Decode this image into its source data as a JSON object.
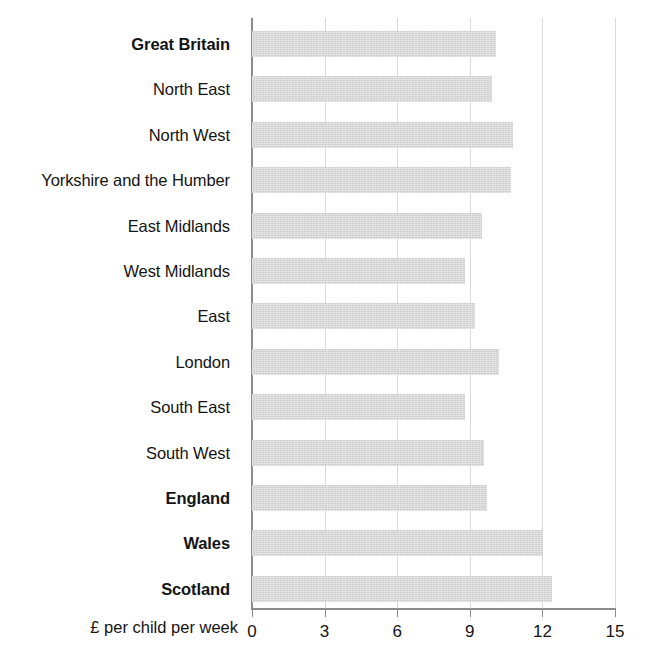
{
  "chart_data": {
    "type": "bar",
    "orientation": "horizontal",
    "title": "",
    "xlabel": "£ per child per week",
    "ylabel": "",
    "xlim": [
      0,
      15
    ],
    "xticks": [
      0,
      3,
      6,
      9,
      12,
      15
    ],
    "xtick_labels": [
      "0",
      "3",
      "6",
      "9",
      "12",
      "15"
    ],
    "grid": true,
    "grid_axis": "x",
    "legend": null,
    "bar_color": "#d6d6d6",
    "axis_color": "#8c8c8c",
    "gridline_color": "#d9d9d9",
    "text_color": "#141414",
    "categories": [
      "Great Britain",
      "North East",
      "North West",
      "Yorkshire and the Humber",
      "East Midlands",
      "West Midlands",
      "East",
      "London",
      "South East",
      "South West",
      "England",
      "Wales",
      "Scotland"
    ],
    "values": [
      10.1,
      9.9,
      10.8,
      10.7,
      9.5,
      8.8,
      9.2,
      10.2,
      8.8,
      9.6,
      9.7,
      12.0,
      12.4
    ],
    "emphasis": [
      true,
      false,
      false,
      false,
      false,
      false,
      false,
      false,
      false,
      false,
      true,
      true,
      true
    ]
  }
}
